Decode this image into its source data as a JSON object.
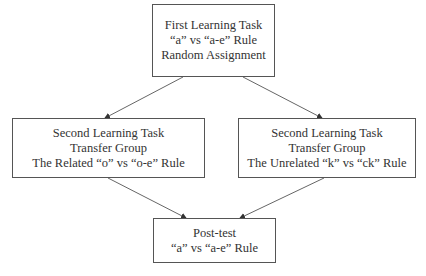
{
  "diagram": {
    "type": "flowchart",
    "nodes": [
      {
        "id": "first",
        "lines": [
          "First Learning Task",
          "“a” vs “a-e” Rule",
          "Random Assignment"
        ]
      },
      {
        "id": "related",
        "lines": [
          "Second Learning Task",
          "Transfer Group",
          "The Related “o” vs “o-e” Rule"
        ]
      },
      {
        "id": "unrelated",
        "lines": [
          "Second Learning Task",
          "Transfer Group",
          "The Unrelated “k” vs “ck” Rule"
        ]
      },
      {
        "id": "posttest",
        "lines": [
          "Post-test",
          "“a” vs “a-e” Rule"
        ]
      }
    ],
    "edges": [
      {
        "from": "first",
        "to": "related"
      },
      {
        "from": "first",
        "to": "unrelated"
      },
      {
        "from": "related",
        "to": "posttest"
      },
      {
        "from": "unrelated",
        "to": "posttest"
      }
    ],
    "colors": {
      "border": "#555555",
      "text": "#333333",
      "arrow": "#555555"
    }
  }
}
